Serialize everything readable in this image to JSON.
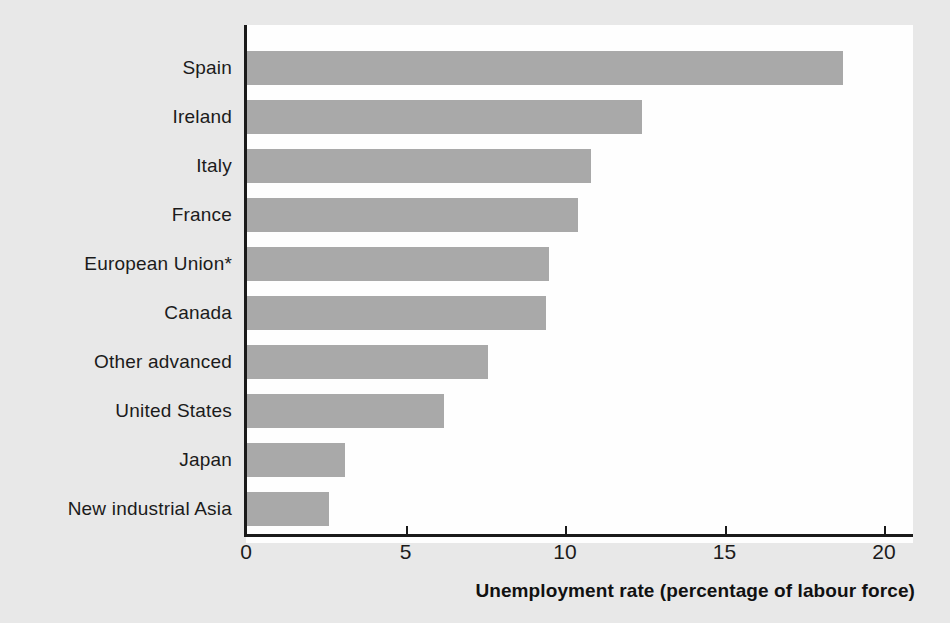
{
  "chart_data": {
    "type": "bar",
    "orientation": "horizontal",
    "title": "",
    "xlabel": "Unemployment rate (percentage of labour force)",
    "ylabel": "",
    "xlim": [
      0,
      21.5
    ],
    "xticks": [
      0,
      5,
      10,
      15,
      20
    ],
    "xtick_labels": [
      "0",
      "5",
      "10",
      "15",
      "20"
    ],
    "grid": false,
    "legend": null,
    "bar_color": "#a9a9a9",
    "axis_color": "#1a1a1a",
    "background_color": "#e8e8e8",
    "plot_background_color": "#fefefe",
    "categories": [
      "Spain",
      "Ireland",
      "Italy",
      "France",
      "European Union*",
      "Canada",
      "Other advanced",
      "United States",
      "Japan",
      "New industrial Asia"
    ],
    "values": [
      18.7,
      12.4,
      10.8,
      10.4,
      9.5,
      9.4,
      7.6,
      6.2,
      3.1,
      2.6
    ],
    "annotations": [
      "*"
    ]
  }
}
